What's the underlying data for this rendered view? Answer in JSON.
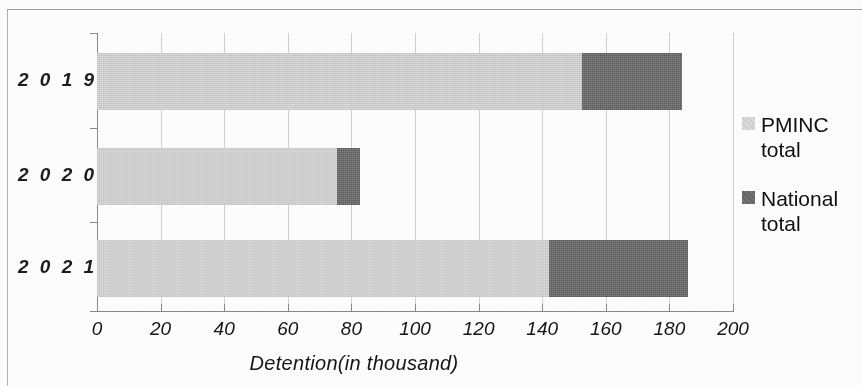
{
  "chart_data": {
    "type": "bar",
    "orientation": "horizontal",
    "stacked": true,
    "title": "",
    "xlabel": "Detention(in thousand)",
    "ylabel": "",
    "categories": [
      "2019",
      "2020",
      "2021"
    ],
    "series": [
      {
        "name": "PMINC total",
        "values": [
          152.5,
          75.5,
          142.0
        ],
        "color": "#d9d9d9"
      },
      {
        "name": "National total",
        "values": [
          31.5,
          7.2,
          44.0
        ],
        "color": "#6e6e6e"
      }
    ],
    "totals": [
      184.0,
      82.7,
      186.0
    ],
    "xlim": [
      0,
      200
    ],
    "xticks": [
      0,
      20,
      40,
      60,
      80,
      100,
      120,
      140,
      160,
      180,
      200
    ],
    "xtick_labels": [
      "0",
      "20",
      "40",
      "60",
      "80",
      "100",
      "120",
      "140",
      "160",
      "180",
      "200"
    ],
    "grid": "vertical",
    "legend_position": "right"
  },
  "axis": {
    "x_title": "Detention(in thousand)",
    "tick_labels": [
      "0",
      "20",
      "40",
      "60",
      "80",
      "100",
      "120",
      "140",
      "160",
      "180",
      "200"
    ]
  },
  "categories": {
    "labels": [
      "2 0 1 9",
      "2 0 2 0",
      "2 0 2 1"
    ]
  },
  "legend": {
    "items": [
      {
        "label_line1": "PMINC",
        "label_line2": "total",
        "swatch": "light-gray-swatch-icon"
      },
      {
        "label_line1": "National",
        "label_line2": "total",
        "swatch": "dark-gray-swatch-icon"
      }
    ]
  }
}
